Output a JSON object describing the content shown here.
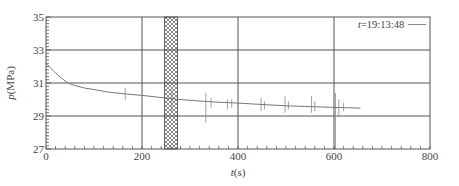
{
  "chart_data": {
    "type": "line",
    "title": "",
    "xlabel": "t(s)",
    "xlabel_italic": "t",
    "xlabel_unit": "(s)",
    "ylabel": "p(MPa)",
    "ylabel_italic": "p",
    "ylabel_unit": "(MPa)",
    "xlim": [
      0,
      800
    ],
    "ylim": [
      27,
      35
    ],
    "x_ticks": [
      0,
      200,
      400,
      600,
      800
    ],
    "y_ticks": [
      27,
      29,
      31,
      33,
      35
    ],
    "x_tick_labels": [
      "0",
      "200",
      "400",
      "600",
      "800"
    ],
    "y_tick_labels": [
      "27",
      "29",
      "31",
      "33",
      "35"
    ],
    "grid": true,
    "legend": {
      "position": "upper right",
      "entries": [
        "t=19:13:48"
      ]
    },
    "highlight_band": {
      "x_start": 247,
      "x_end": 274,
      "pattern": "crosshatch"
    },
    "series": [
      {
        "name": "t=19:13:48",
        "x": [
          0,
          10,
          20,
          30,
          45,
          60,
          80,
          100,
          130,
          160,
          200,
          230,
          260,
          300,
          350,
          400,
          450,
          500,
          550,
          600,
          655
        ],
        "y": [
          32.2,
          31.9,
          31.6,
          31.35,
          31.0,
          30.85,
          30.7,
          30.6,
          30.45,
          30.35,
          30.25,
          30.15,
          30.05,
          29.95,
          29.85,
          29.78,
          29.7,
          29.62,
          29.57,
          29.52,
          29.48
        ]
      }
    ],
    "spikes": [
      {
        "x": 165,
        "low": 30.0,
        "high": 30.7
      },
      {
        "x": 262,
        "low": 29.3,
        "high": 30.6
      },
      {
        "x": 333,
        "low": 28.6,
        "high": 30.4
      },
      {
        "x": 344,
        "low": 29.5,
        "high": 30.1
      },
      {
        "x": 378,
        "low": 29.4,
        "high": 30.0
      },
      {
        "x": 387,
        "low": 29.5,
        "high": 30.0
      },
      {
        "x": 448,
        "low": 29.3,
        "high": 30.1
      },
      {
        "x": 455,
        "low": 29.4,
        "high": 29.9
      },
      {
        "x": 498,
        "low": 29.2,
        "high": 30.2
      },
      {
        "x": 505,
        "low": 29.4,
        "high": 29.9
      },
      {
        "x": 553,
        "low": 29.2,
        "high": 30.2
      },
      {
        "x": 560,
        "low": 29.3,
        "high": 29.9
      },
      {
        "x": 603,
        "low": 27.0,
        "high": 30.4
      },
      {
        "x": 610,
        "low": 29.0,
        "high": 30.0
      },
      {
        "x": 620,
        "low": 29.3,
        "high": 29.8
      }
    ]
  }
}
